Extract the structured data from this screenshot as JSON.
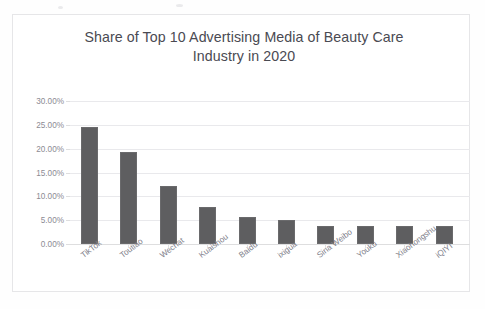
{
  "chart_data": {
    "type": "bar",
    "title": "Share of Top 10 Advertising Media of Beauty Care Industry in 2020",
    "title_lines": [
      "Share of Top 10 Advertising Media of Beauty Care",
      "Industry in 2020"
    ],
    "xlabel": "",
    "ylabel": "",
    "ylim": [
      0,
      30
    ],
    "ytick_values": [
      30,
      25,
      20,
      15,
      10,
      5,
      0
    ],
    "ytick_labels": [
      "30.00%",
      "25.00%",
      "20.00%",
      "15.00%",
      "10.00%",
      "5.00%",
      "0.00%"
    ],
    "grid": true,
    "legend": false,
    "legend_position": "none",
    "categories": [
      "TikTok",
      "Toutiao",
      "Wechat",
      "Kuaishou",
      "Baidu",
      "ixigua",
      "Sina Weibo",
      "Youku",
      "Xiaohongshu",
      "iQIYI"
    ],
    "values": [
      24.5,
      19.4,
      12.2,
      7.8,
      5.6,
      5.0,
      3.8,
      3.8,
      3.8,
      3.7
    ],
    "value_unit": "%",
    "series": [
      {
        "name": "Share",
        "values": [
          24.5,
          19.4,
          12.2,
          7.8,
          5.6,
          5.0,
          3.8,
          3.8,
          3.8,
          3.7
        ]
      }
    ],
    "colors": {
      "bar": "#5e5e60",
      "gridline": "#e9e9ec",
      "axis": "#dededf",
      "title_text": "#4a4a52",
      "tick_text": "#8b8b93",
      "frame": "#e6e6e8",
      "background": "#ffffff"
    }
  }
}
